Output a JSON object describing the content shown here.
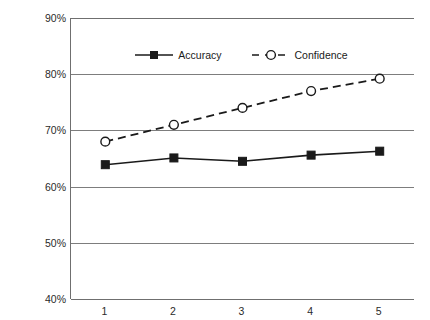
{
  "chart_data": {
    "type": "line",
    "title": "",
    "xlabel": "",
    "ylabel": "Proportion Correct",
    "x": [
      1,
      2,
      3,
      4,
      5
    ],
    "xtick_labels": [
      "1",
      "2",
      "3",
      "4",
      "5"
    ],
    "ytick_labels": [
      "90%",
      "80%",
      "70%",
      "60%",
      "50%",
      "40%"
    ],
    "ytick_values": [
      90,
      80,
      70,
      60,
      50,
      40
    ],
    "ylim": [
      40,
      90
    ],
    "xlim": [
      0.5,
      5.5
    ],
    "grid": "horizontal",
    "legend_position": "top-center",
    "series": [
      {
        "name": "Accuracy",
        "values": [
          63.9,
          65.1,
          64.5,
          65.6,
          66.3
        ],
        "line_style": "solid",
        "marker": "filled-square",
        "color": "#1a1a1a"
      },
      {
        "name": "Confidence",
        "values": [
          68.0,
          71.0,
          74.0,
          77.0,
          79.2
        ],
        "line_style": "dashed",
        "marker": "open-circle",
        "color": "#1a1a1a"
      }
    ]
  },
  "legend": {
    "entries": [
      {
        "label": "Accuracy"
      },
      {
        "label": "Confidence"
      }
    ]
  },
  "axes": {
    "y_title": "Proportion Correct"
  }
}
